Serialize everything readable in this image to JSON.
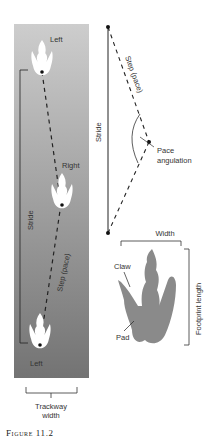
{
  "caption": "Figure 11.2",
  "trackway_panel": {
    "labels": {
      "top_print": "Left",
      "middle_print": "Right",
      "bottom_print": "Left",
      "stride": "Stride",
      "step": "Step (pace)",
      "trackway_width": [
        "Trackway",
        "width"
      ]
    },
    "colors": {
      "gradient_top": "#cdcdcd",
      "gradient_bottom": "#737373",
      "print": "#ffffff"
    }
  },
  "angulation_diagram": {
    "labels": {
      "stride": "Stride",
      "step": "Step (pace)",
      "pace_angulation": [
        "Pace",
        "angulation"
      ]
    }
  },
  "footprint_diagram": {
    "labels": {
      "width": "Width",
      "claw": "Claw",
      "pad": "Pad",
      "footprint_length": "Footprint length"
    },
    "colors": {
      "print": "#8a8a8a"
    }
  }
}
